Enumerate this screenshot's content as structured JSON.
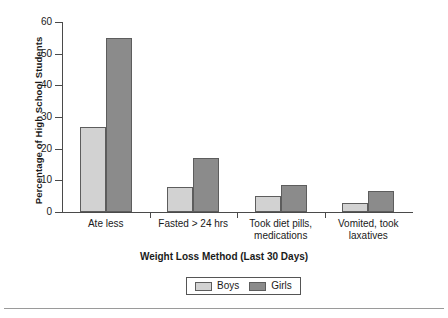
{
  "chart_data": {
    "type": "bar",
    "title": "",
    "xlabel": "Weight Loss Method (Last 30 Days)",
    "ylabel": "Percentage of High School Students",
    "categories": [
      "Ate less",
      "Fasted > 24 hrs",
      "Took diet pills,\nmedications",
      "Vomited, took\nlaxatives"
    ],
    "category_lines": [
      [
        "Ate less"
      ],
      [
        "Fasted > 24 hrs"
      ],
      [
        "Took diet pills,",
        "medications"
      ],
      [
        "Vomited, took",
        "laxatives"
      ]
    ],
    "series": [
      {
        "name": "Boys",
        "color": "#d2d2d2",
        "values": [
          27,
          8,
          5,
          3
        ]
      },
      {
        "name": "Girls",
        "color": "#8b8b8b",
        "values": [
          55,
          17,
          8.5,
          6.5
        ]
      }
    ],
    "ylim": [
      0,
      60
    ],
    "ytick_values": [
      0,
      10,
      20,
      30,
      40,
      50,
      60
    ],
    "ytick_labels": [
      "0",
      "10",
      "20",
      "30",
      "40",
      "50",
      "60"
    ],
    "grid": false,
    "legend_position": "bottom-center",
    "legend_entries": [
      "Boys",
      "Girls"
    ]
  }
}
